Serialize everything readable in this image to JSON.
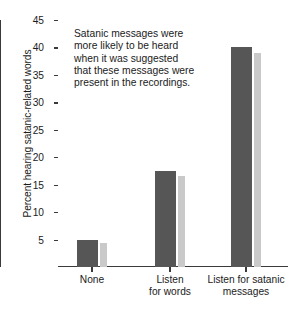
{
  "chart_data": {
    "type": "bar",
    "title": "",
    "xlabel": "",
    "ylabel": "Percent hearing satanic-related words",
    "categories": [
      "None",
      "Listen\nfor words",
      "Listen for satanic\nmessages"
    ],
    "category_lines": [
      [
        "None"
      ],
      [
        "Listen",
        "for words"
      ],
      [
        "Listen for satanic",
        "messages"
      ]
    ],
    "series": [
      {
        "name": "dark",
        "color": "#565656",
        "values": [
          5.0,
          17.4,
          40.0
        ]
      },
      {
        "name": "light",
        "color": "#c9c9c9",
        "values": [
          4.3,
          16.5,
          39.0
        ]
      }
    ],
    "ylim": [
      0,
      45
    ],
    "yticks": [
      5,
      10,
      15,
      20,
      25,
      30,
      35,
      40,
      45
    ],
    "ytick_labels": [
      "5",
      "10",
      "15",
      "20",
      "25",
      "30",
      "35",
      "40",
      "45"
    ],
    "grid": false,
    "legend": "none",
    "annotation": {
      "lines": [
        "Satanic messages were",
        "more likely to be heard",
        "when it was suggested",
        "that these messages were",
        "present in the recordings."
      ]
    }
  },
  "colors": {
    "axis": "#3a3a3a",
    "text": "#1b1b1b",
    "background": "#ffffff",
    "bar_dark": "#565656",
    "bar_light": "#c9c9c9"
  }
}
